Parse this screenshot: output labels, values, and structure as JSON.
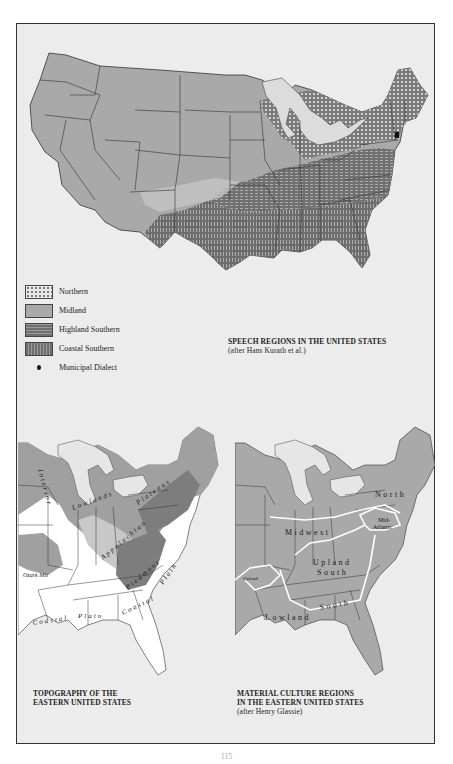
{
  "page": {
    "page_number": "115"
  },
  "maps": {
    "speech_regions": {
      "title": "SPEECH REGIONS IN THE UNITED STATES",
      "source": "(after Hans Kurath et al.)",
      "legend": [
        {
          "label": "Northern",
          "pattern": "dotted",
          "color": "#e8e8e8"
        },
        {
          "label": "Midland",
          "pattern": "solid",
          "color": "#a9a9a9"
        },
        {
          "label": "Highland Southern",
          "pattern": "horizontal-dash",
          "color": "#6f6f6f"
        },
        {
          "label": "Coastal Southern",
          "pattern": "vertical-dash",
          "color": "#6f6f6f"
        },
        {
          "label": "Municipal Dialect",
          "pattern": "dot-marker",
          "color": "#111111"
        }
      ]
    },
    "topography": {
      "title_line1": "TOPOGRAPHY OF THE",
      "title_line2": "EASTERN UNITED STATES",
      "labels": {
        "interior": "Interior",
        "lowlands": "Lowlands",
        "plateaus": "Plateaus",
        "appalachian": "Appalachian",
        "ozark": "Ozark Mts",
        "piedmont": "Piedmont",
        "coastal_plain_1": "Coastal",
        "coastal_plain_2": "Plain",
        "coastal_plain_3": "Coastal",
        "plain_ne": "Plain"
      }
    },
    "material_culture": {
      "title_line1": "MATERIAL CULTURE REGIONS",
      "title_line2": "IN THE EASTERN UNITED STATES",
      "source": "(after Henry Glassie)",
      "labels": {
        "north": "North",
        "mid_atlantic_1": "Mid-",
        "mid_atlantic_2": "Atlantic",
        "midwest": "Midwest",
        "upland_1": "Upland",
        "upland_2": "South",
        "lowland_1": "Lowland",
        "lowland_2": "South",
        "upland_small": "Upland",
        "ne_small": "Mid"
      }
    }
  },
  "colors": {
    "frame_bg": "#ececec",
    "state_fill": "#a9a9a9",
    "border": "#333333",
    "water": "#ececec"
  }
}
